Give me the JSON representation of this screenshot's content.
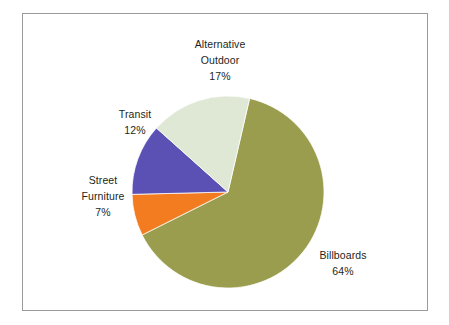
{
  "chart_data": {
    "type": "pie",
    "title": "",
    "subtitle": "",
    "xlabel": "",
    "ylabel": "",
    "legend_position": "none",
    "grid": false,
    "labels_outside": true,
    "start_angle_deg": 13,
    "direction": "clockwise",
    "categories": [
      "Alternative Outdoor",
      "Billboards",
      "Street Furniture",
      "Transit"
    ],
    "values": [
      17,
      64,
      7,
      12
    ],
    "value_suffix": "%",
    "slices": [
      {
        "name": "alternative-outdoor",
        "label_line1": "Alternative",
        "label_line2": "Outdoor",
        "value": 17,
        "value_text": "17%",
        "color": "#dfe8d5",
        "start_angle_deg": 274.0,
        "end_angle_deg": 335.2
      },
      {
        "name": "billboards",
        "label_line1": "Billboards",
        "label_line2": "",
        "value": 64,
        "value_text": "64%",
        "color": "#9a9c4e",
        "start_angle_deg": 13.0,
        "end_angle_deg": 243.4
      },
      {
        "name": "street-furniture",
        "label_line1": "Street",
        "label_line2": "Furniture",
        "value": 7,
        "value_text": "7%",
        "color": "#f47c20",
        "start_angle_deg": 243.4,
        "end_angle_deg": 268.6
      },
      {
        "name": "transit",
        "label_line1": "Transit",
        "label_line2": "",
        "value": 12,
        "value_text": "12%",
        "color": "#5b51b5",
        "start_angle_deg": 268.6,
        "end_angle_deg": 312.8
      }
    ]
  },
  "figure": {
    "background_color": "#ffffff",
    "frame_color": "#9b9b9e",
    "text_color": "#231f20"
  },
  "pie": {
    "center_x": 228,
    "center_y": 192,
    "radius": 96
  }
}
